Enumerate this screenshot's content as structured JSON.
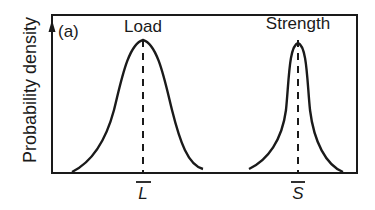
{
  "figure": {
    "panel_label": "(a)",
    "y_axis_label": "Probability density",
    "curves": [
      {
        "name": "Load",
        "mean_label": "L",
        "mean_symbol": "L-bar",
        "peak": {
          "x": 143,
          "y": 40
        },
        "shape": "wide bell curve"
      },
      {
        "name": "Strength",
        "mean_label": "S",
        "mean_symbol": "S-bar",
        "peak": {
          "x": 298,
          "y": 43
        },
        "shape": "narrow peaked curve"
      }
    ],
    "colors": {
      "line": "#1a1a1a",
      "background": "#ffffff"
    }
  }
}
